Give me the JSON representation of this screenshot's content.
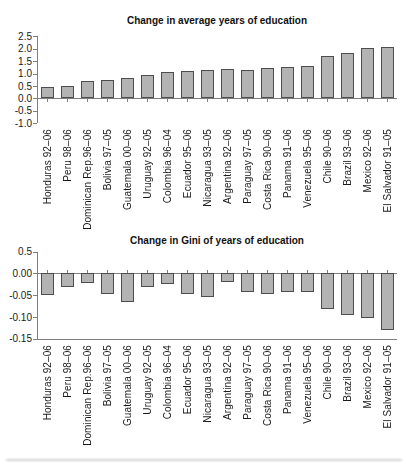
{
  "chart_data": [
    {
      "type": "bar",
      "title": "Change in average years of education",
      "categories": [
        "Honduras 92–06",
        "Peru 98–06",
        "Dominican Rep.96–06",
        "Bolivia 97–05",
        "Guatemala 00–06",
        "Uruguay 92–05",
        "Colombia 96–04",
        "Ecuador 95–06",
        "Nicaragua 93–05",
        "Argentina 92–06",
        "Paraguay 97–05",
        "Costa Rica 90–06",
        "Panama 91–06",
        "Venezuela 95–06",
        "Chile 90–06",
        "Brazil 93–06",
        "Mexico 92–06",
        "El Salvador 91–05"
      ],
      "values": [
        0.45,
        0.49,
        0.7,
        0.75,
        0.81,
        0.96,
        1.05,
        1.1,
        1.15,
        1.2,
        1.16,
        1.21,
        1.26,
        1.3,
        1.7,
        1.84,
        2.02,
        2.08
      ],
      "ylim": [
        -1.0,
        2.5
      ],
      "y_ticks": [
        {
          "label": "2.5",
          "value": 2.5
        },
        {
          "label": "2.0",
          "value": 2.0
        },
        {
          "label": "1.5",
          "value": 1.5
        },
        {
          "label": "1.0",
          "value": 1.0
        },
        {
          "label": "0.5",
          "value": 0.5
        },
        {
          "label": "0.0",
          "value": 0.0
        },
        {
          "label": "-0.5",
          "value": -0.5
        },
        {
          "label": "-1.0",
          "value": -1.0
        }
      ],
      "grid": false,
      "legend_position": "none",
      "bar_color": "#b3b3b3",
      "bar_border_color": "#4d4d4d",
      "axis_color": "#7f7f7f",
      "text_color": "#1a1a1a"
    },
    {
      "type": "bar",
      "title": "Change in Gini of years of education",
      "categories": [
        "Honduras 92–06",
        "Peru 98–06",
        "Dominican Rep.96–06",
        "Bolivia 97–05",
        "Guatemala 00–06",
        "Uruguay 92–05",
        "Colombia 96–04",
        "Ecuador 95–06",
        "Nicaragua 93–05",
        "Argentina 92–06",
        "Paraguay 97–05",
        "Costa Rica 90–06",
        "Panama 91–06",
        "Venezuela 95–06",
        "Chile 90–06",
        "Brazil 93–06",
        "Mexico 92–06",
        "El Salvador 91–05"
      ],
      "values": [
        -0.05,
        -0.031,
        -0.021,
        -0.046,
        -0.065,
        -0.032,
        -0.025,
        -0.046,
        -0.055,
        -0.019,
        -0.042,
        -0.046,
        -0.043,
        -0.043,
        -0.081,
        -0.095,
        -0.101,
        -0.13
      ],
      "ylim": [
        -0.15,
        0.05
      ],
      "y_ticks": [
        {
          "label": "0.5",
          "value": 0.05
        },
        {
          "label": "0.00",
          "value": 0.0
        },
        {
          "label": "-0.05",
          "value": -0.05
        },
        {
          "label": "-0.10",
          "value": -0.1
        },
        {
          "label": "-0.15",
          "value": -0.15
        }
      ],
      "grid": false,
      "legend_position": "none",
      "bar_color": "#b3b3b3",
      "bar_border_color": "#4d4d4d",
      "axis_color": "#7f7f7f",
      "text_color": "#1a1a1a"
    }
  ]
}
